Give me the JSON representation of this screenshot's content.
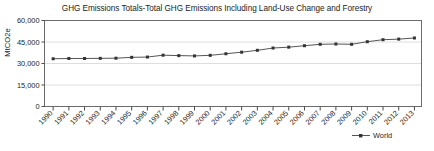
{
  "chart_data": {
    "type": "line",
    "title": "GHG Emissions Totals-Total GHG Emissions Including Land-Use Change and Forestry",
    "xlabel": "",
    "ylabel": "MtCO2e",
    "legend": [
      "World"
    ],
    "legend_position": "bottom-right",
    "grid": "horizontal",
    "ylim": [
      0,
      60000
    ],
    "yticks": [
      0,
      15000,
      30000,
      45000,
      60000
    ],
    "ytick_labels": [
      "0",
      "15,000",
      "30,000",
      "45,000",
      "60,000"
    ],
    "categories": [
      "1990",
      "1991",
      "1992",
      "1993",
      "1994",
      "1995",
      "1996",
      "1997",
      "1998",
      "1999",
      "2000",
      "2001",
      "2002",
      "2003",
      "2004",
      "2005",
      "2006",
      "2007",
      "2008",
      "2009",
      "2010",
      "2011",
      "2012",
      "2013"
    ],
    "series": [
      {
        "name": "World",
        "color": "#555555",
        "marker": "square",
        "values": [
          33300,
          33500,
          33500,
          33600,
          33700,
          34300,
          34500,
          35800,
          35500,
          35300,
          35700,
          36800,
          37900,
          39200,
          40800,
          41400,
          42400,
          43400,
          43600,
          43400,
          45200,
          46600,
          47000,
          47800
        ]
      }
    ]
  },
  "legend": {
    "world_label": "World"
  },
  "axis": {
    "y_label": "MtCO2e"
  },
  "title": {
    "text": "GHG Emissions Totals-Total GHG Emissions Including Land-Use Change and Forestry"
  }
}
